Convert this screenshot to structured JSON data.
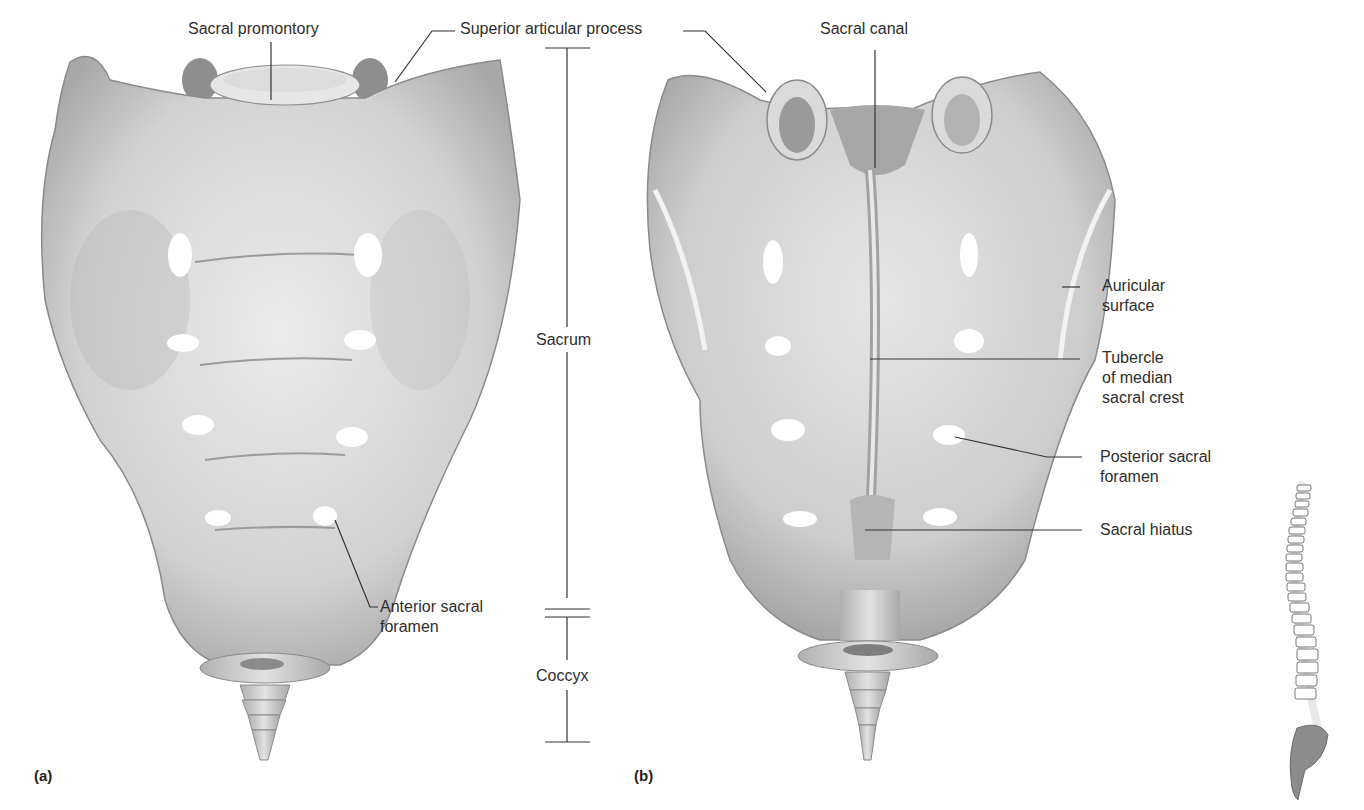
{
  "figure": {
    "panels": [
      {
        "id": "a",
        "tag": "(a)",
        "view": "anterior"
      },
      {
        "id": "b",
        "tag": "(b)",
        "view": "posterior"
      }
    ]
  },
  "labels": {
    "sacral_promontory": "Sacral promontory",
    "superior_articular_process": "Superior articular process",
    "sacral_canal": "Sacral canal",
    "auricular_surface_l1": "Auricular",
    "auricular_surface_l2": "surface",
    "tubercle_l1": "Tubercle",
    "tubercle_l2": "of median",
    "tubercle_l3": "sacral crest",
    "posterior_foramen_l1": "Posterior sacral",
    "posterior_foramen_l2": "foramen",
    "sacral_hiatus": "Sacral hiatus",
    "anterior_foramen_l1": "Anterior sacral",
    "anterior_foramen_l2": "foramen",
    "sacrum": "Sacrum",
    "coccyx": "Coccyx"
  },
  "colors": {
    "bone": "#d9d9d9",
    "bone_shadow": "#9a9a9a",
    "leader_line": "#333333",
    "spine_highlight": "#8c8c8c"
  },
  "icons": {
    "spine_locator": "vertebral-column-locator-icon"
  }
}
